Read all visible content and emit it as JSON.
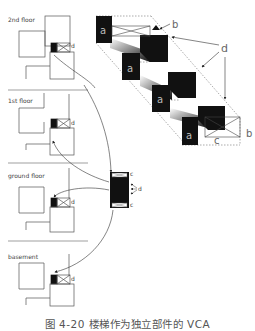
{
  "floors": [
    {
      "label": "2nd floor",
      "marker": "d"
    },
    {
      "label": "1st floor",
      "marker": "d"
    },
    {
      "label": "ground floor",
      "marker": "d"
    },
    {
      "label": "basement",
      "marker": "d"
    }
  ],
  "module": {
    "top_label": "c",
    "bottom_label": "c",
    "side_label": "d"
  },
  "isometric": {
    "block_label": "a",
    "labels": {
      "b_top": "b",
      "b_right": "b",
      "c": "c",
      "d": "d"
    }
  },
  "caption": "图 4-20  楼梯作为独立部件的 VCA"
}
